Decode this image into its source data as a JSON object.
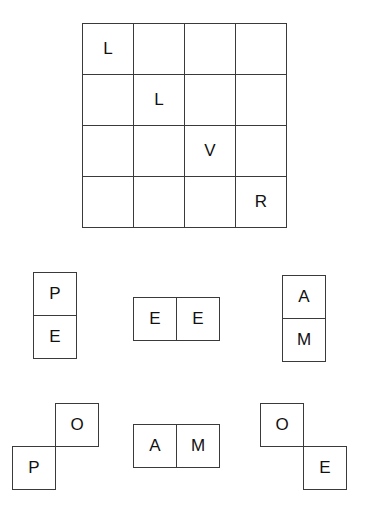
{
  "grid": {
    "rows": 4,
    "cols": 4,
    "cells": [
      [
        "L",
        "",
        "",
        ""
      ],
      [
        "",
        "L",
        "",
        ""
      ],
      [
        "",
        "",
        "V",
        ""
      ],
      [
        "",
        "",
        "",
        "R"
      ]
    ]
  },
  "pieces": [
    {
      "id": "piece-pe-vertical",
      "orientation": "vertical",
      "letters": [
        "P",
        "E"
      ]
    },
    {
      "id": "piece-ee-horizontal",
      "orientation": "horizontal",
      "letters": [
        "E",
        "E"
      ]
    },
    {
      "id": "piece-am-vertical",
      "orientation": "vertical",
      "letters": [
        "A",
        "M"
      ]
    },
    {
      "id": "piece-op-diagonal",
      "orientation": "diagonal-up-right",
      "letters": [
        "O",
        "P"
      ]
    },
    {
      "id": "piece-am-horizontal",
      "orientation": "horizontal",
      "letters": [
        "A",
        "M"
      ]
    },
    {
      "id": "piece-oe-diagonal",
      "orientation": "diagonal-down-right",
      "letters": [
        "O",
        "E"
      ]
    }
  ]
}
